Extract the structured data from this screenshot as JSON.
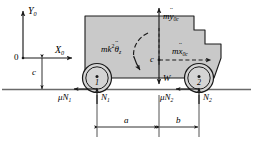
{
  "figure": {
    "background": "#ffffff",
    "ink": "#1a1a1a",
    "body_fill": "#c9c9c9",
    "wheel_fill": "#d4d4d4",
    "width": 253,
    "height": 141
  },
  "axes": {
    "origin_label": "0",
    "y_axis_label": "Y",
    "y_axis_sub": "0",
    "x_axis_label": "X",
    "x_axis_sub": "0"
  },
  "dimensions": {
    "height_label": "c",
    "front_distance_label": "a",
    "rear_distance_label": "b"
  },
  "center_of_mass": {
    "label": "c"
  },
  "wheels": [
    {
      "id": "wheel-1",
      "label": "1"
    },
    {
      "id": "wheel-2",
      "label": "2"
    }
  ],
  "forces": {
    "vertical_inertia": {
      "prefix": "m",
      "symbol": "y",
      "sub": "0c",
      "direction": "up"
    },
    "horizontal_inertia": {
      "prefix": "m",
      "symbol": "x",
      "sub": "0c",
      "direction": "right"
    },
    "rotational_inertia": {
      "prefix": "mk",
      "exponent": "2",
      "symbol": "θ",
      "sub": "z",
      "direction": "clockwise"
    },
    "weight": {
      "label": "W",
      "direction": "down"
    },
    "friction_front": {
      "mu": "μ",
      "symbol": "N",
      "sub": "1",
      "direction": "left"
    },
    "normal_front": {
      "symbol": "N",
      "sub": "1",
      "direction": "up"
    },
    "friction_rear": {
      "mu": "μ",
      "symbol": "N",
      "sub": "2",
      "direction": "left"
    },
    "normal_rear": {
      "symbol": "N",
      "sub": "2",
      "direction": "up"
    }
  }
}
